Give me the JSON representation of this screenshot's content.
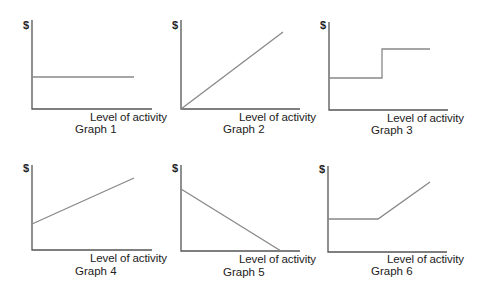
{
  "diagram": {
    "y_axis_label": "$",
    "x_axis_label": "Level of activity",
    "axis_color": "#555555",
    "line_color": "#888888",
    "graphs": [
      {
        "title": "Graph 1",
        "shape": "horizontal line (fixed cost)"
      },
      {
        "title": "Graph 2",
        "shape": "line rising from origin (variable cost)"
      },
      {
        "title": "Graph 3",
        "shape": "step function (step cost)"
      },
      {
        "title": "Graph 4",
        "shape": "rising line with positive intercept (mixed cost)"
      },
      {
        "title": "Graph 5",
        "shape": "declining line to zero"
      },
      {
        "title": "Graph 6",
        "shape": "flat then rising line"
      }
    ]
  }
}
